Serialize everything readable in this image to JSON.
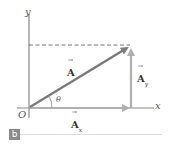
{
  "diagram": {
    "axes": {
      "x_label": "x",
      "y_label": "y",
      "origin_label": "O"
    },
    "vectors": {
      "resultant": {
        "label": "A",
        "color": "#888888"
      },
      "x_component": {
        "label": "A",
        "subscript": "x",
        "color": "#aaaaaa"
      },
      "y_component": {
        "label": "A",
        "subscript": "y",
        "color": "#aaaaaa"
      }
    },
    "angle_label": "θ",
    "panel_label": "b"
  }
}
